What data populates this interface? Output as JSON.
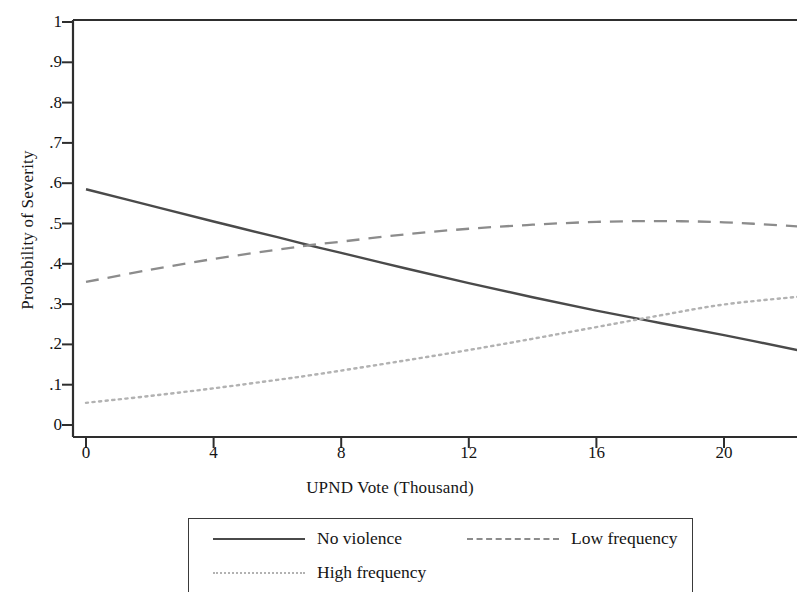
{
  "chart_data": {
    "type": "line",
    "title": "",
    "xlabel": "UPND Vote (Thousand)",
    "ylabel": "Probability of Severity",
    "xlim": [
      -0.45,
      22.35
    ],
    "ylim": [
      0,
      1.03
    ],
    "xticks": [
      0,
      4,
      8,
      12,
      16,
      20
    ],
    "xtick_labels": [
      "0",
      "4",
      "8",
      "12",
      "16",
      "20"
    ],
    "yticks": [
      0,
      0.1,
      0.2,
      0.3,
      0.4,
      0.5,
      0.6,
      0.7,
      0.8,
      0.9,
      1
    ],
    "ytick_labels": [
      "0",
      ".1",
      ".2",
      ".3",
      ".4",
      ".5",
      ".6",
      ".7",
      ".8",
      ".9",
      "1"
    ],
    "grid": false,
    "legend_position": "below-plot",
    "series": [
      {
        "name": "No violence",
        "style": "solid",
        "color": "#4a4a4a",
        "x": [
          0,
          2,
          4,
          6,
          7,
          8,
          10,
          12,
          14,
          16,
          18,
          20,
          22.3
        ],
        "values": [
          0.585,
          0.545,
          0.505,
          0.466,
          0.446,
          0.427,
          0.389,
          0.352,
          0.317,
          0.284,
          0.253,
          0.223,
          0.186
        ]
      },
      {
        "name": "Low frequency",
        "style": "dashed",
        "color": "#8c8c8c",
        "x": [
          0,
          2,
          4,
          6,
          7,
          8,
          10,
          12,
          14,
          16,
          18,
          20,
          22.3
        ],
        "values": [
          0.355,
          0.385,
          0.412,
          0.435,
          0.446,
          0.455,
          0.473,
          0.487,
          0.497,
          0.504,
          0.506,
          0.503,
          0.493
        ]
      },
      {
        "name": "High frequency",
        "style": "dotted",
        "color": "#b2b2b2",
        "x": [
          0,
          2,
          4,
          6,
          7,
          8,
          10,
          12,
          14,
          16,
          18,
          20,
          22.3
        ],
        "values": [
          0.055,
          0.072,
          0.091,
          0.112,
          0.123,
          0.135,
          0.16,
          0.186,
          0.214,
          0.243,
          0.272,
          0.299,
          0.318
        ]
      }
    ],
    "annotations": {
      "crossing_solid_dashed": {
        "x": 7.0,
        "y": 0.446
      },
      "crossing_solid_dotted": {
        "x": 18.6,
        "y": 0.248
      }
    }
  },
  "legend": {
    "entries": [
      {
        "label": "No violence",
        "style": "solid"
      },
      {
        "label": "Low frequency",
        "style": "dashed"
      },
      {
        "label": "High frequency",
        "style": "dotted"
      }
    ]
  },
  "axes": {
    "y_title": "Probability of Severity",
    "x_title": "UPND Vote (Thousand)"
  },
  "colors": {
    "solid_line": "#4a4a4a",
    "dashed_line": "#8c8c8c",
    "dotted_line": "#b2b2b2",
    "axis": "#2e2e2e",
    "background": "#ffffff"
  }
}
